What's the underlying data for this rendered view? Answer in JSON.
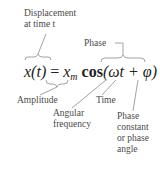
{
  "equation": {
    "lhs": "x(t)",
    "equals": "=",
    "amplitude_symbol": "x",
    "amplitude_subscript": "m",
    "function": "cos",
    "argument": "(ωt + φ)"
  },
  "labels": {
    "displacement_line1": "Displacement",
    "displacement_line2": "at time t",
    "phase": "Phase",
    "amplitude": "Amplitude",
    "time": "Time",
    "angular_line1": "Angular",
    "angular_line2": "frequency",
    "phase_constant_line1": "Phase",
    "phase_constant_line2": "constant",
    "phase_constant_line3": "or phase",
    "phase_constant_line4": "angle"
  },
  "colors": {
    "text": "#4a4a4a",
    "equation": "#222222",
    "lines": "#8a8a8a"
  }
}
